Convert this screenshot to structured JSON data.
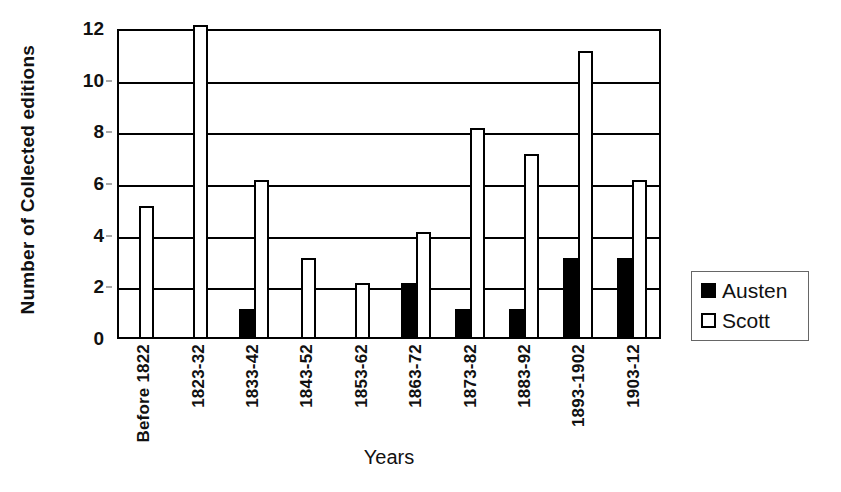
{
  "chart_data": {
    "type": "bar",
    "title": "",
    "xlabel": "Years",
    "ylabel": "Number of Collected editions",
    "ylim": [
      0,
      12
    ],
    "yticks": [
      0,
      2,
      4,
      6,
      8,
      10,
      12
    ],
    "grid": true,
    "legend_position": "right",
    "categories": [
      "Before 1822",
      "1823-32",
      "1833-42",
      "1843-52",
      "1853-62",
      "1863-72",
      "1873-82",
      "1883-92",
      "1893-1902",
      "1903-12"
    ],
    "series": [
      {
        "name": "Austen",
        "color": "#000000",
        "values": [
          0,
          0,
          1,
          0,
          0,
          2,
          1,
          1,
          3,
          3
        ]
      },
      {
        "name": "Scott",
        "color": "#ffffff",
        "values": [
          5,
          12,
          6,
          3,
          2,
          4,
          8,
          7,
          11,
          6
        ]
      }
    ]
  },
  "legend": {
    "items": [
      {
        "label": "Austen",
        "swatch": "filled-square"
      },
      {
        "label": "Scott",
        "swatch": "hollow-square"
      }
    ]
  }
}
